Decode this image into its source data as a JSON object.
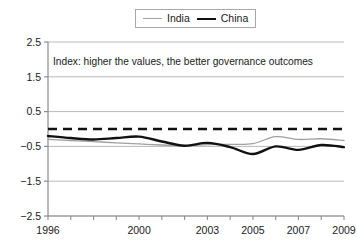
{
  "legend": {
    "position": "top-center",
    "entries": [
      {
        "label": "India",
        "color": "#a0a0a0",
        "width": 1,
        "style": "solid",
        "icon": "line-swatch-icon"
      },
      {
        "label": "China",
        "color": "#111111",
        "width": 2.4,
        "style": "solid",
        "icon": "line-swatch-icon"
      }
    ]
  },
  "annotation": {
    "text": "Index: higher the values, the better governance outcomes"
  },
  "chart_data": {
    "type": "line",
    "title": "",
    "xlabel": "",
    "ylabel": "",
    "xlim": [
      1996,
      2009
    ],
    "ylim": [
      -2.5,
      2.5
    ],
    "yticks": [
      2.5,
      1.5,
      0.5,
      -0.5,
      -1.5,
      -2.5
    ],
    "ytick_labels": [
      "2.5",
      "1.5",
      "0.5",
      "-0.5",
      "-1.5",
      "-2.5"
    ],
    "xticks": [
      1996,
      1997,
      1998,
      1999,
      2000,
      2001,
      2002,
      2003,
      2004,
      2005,
      2006,
      2007,
      2008,
      2009
    ],
    "xtick_labels_shown": [
      "1996",
      "2000",
      "2003",
      "2005",
      "2007",
      "2009"
    ],
    "xtick_label_values": [
      1996,
      2000,
      2003,
      2005,
      2007,
      2009
    ],
    "grid": "horizontal",
    "zero_reference_line": {
      "value": 0,
      "style": "dashed",
      "color": "#111111",
      "width": 2.6
    },
    "x": [
      1996,
      1997,
      1998,
      1999,
      2000,
      2001,
      2002,
      2003,
      2004,
      2005,
      2006,
      2007,
      2008,
      2009
    ],
    "series": [
      {
        "name": "India",
        "color": "#a0a0a0",
        "width": 1.3,
        "values": [
          -0.3,
          -0.33,
          -0.36,
          -0.4,
          -0.43,
          -0.46,
          -0.48,
          -0.45,
          -0.44,
          -0.42,
          -0.22,
          -0.3,
          -0.28,
          -0.33
        ]
      },
      {
        "name": "China",
        "color": "#111111",
        "width": 2.4,
        "values": [
          -0.2,
          -0.26,
          -0.3,
          -0.26,
          -0.22,
          -0.36,
          -0.48,
          -0.4,
          -0.52,
          -0.72,
          -0.5,
          -0.6,
          -0.46,
          -0.52
        ]
      }
    ]
  }
}
